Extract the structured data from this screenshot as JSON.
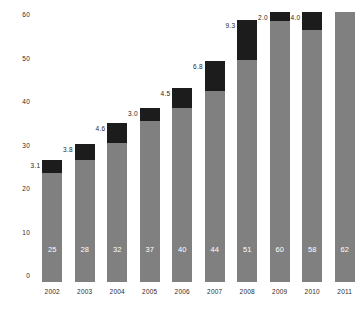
{
  "chart_data": {
    "type": "bar",
    "subtype": "stacked-bar",
    "title": "",
    "xlabel": "",
    "ylabel": "",
    "categories": [
      "2002",
      "2003",
      "2004",
      "2005",
      "2006",
      "2007",
      "2008",
      "2009",
      "2010",
      "2011"
    ],
    "series": [
      {
        "name": "base",
        "color": "#808080",
        "values": [
          25,
          28,
          32,
          37,
          40,
          44,
          51,
          60,
          58,
          62
        ],
        "labels": [
          "25",
          "28",
          "32",
          "37",
          "40",
          "44",
          "51",
          "60",
          "58",
          "62"
        ],
        "label_position": "inside-bottom",
        "label_color": "#ffffff"
      },
      {
        "name": "top",
        "color": "#1c1c1c",
        "values": [
          3.1,
          3.8,
          4.6,
          3.0,
          4.5,
          6.8,
          9.3,
          2.0,
          4.0,
          null
        ],
        "labels": [
          "3.1",
          "3.8",
          "4.6",
          "3.0",
          "4.5",
          "6.8",
          "9.3",
          "2.0",
          "4.0",
          ""
        ],
        "label_position": "outside-left",
        "label_color": "#1f1f1f"
      }
    ],
    "y_ticks": [
      0,
      10,
      20,
      30,
      40,
      50,
      60
    ],
    "y_tick_labels": [
      "0",
      "10",
      "20",
      "30",
      "40",
      "50",
      "60"
    ],
    "ylim": [
      0,
      63
    ],
    "grid": false,
    "legend": "none",
    "axis_lines": "none"
  }
}
